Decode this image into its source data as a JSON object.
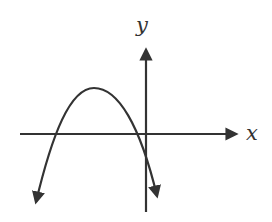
{
  "diagram": {
    "type": "graph-of-function",
    "axes": {
      "x_label": "x",
      "y_label": "y"
    },
    "curve": {
      "kind": "parabola",
      "opens": "down",
      "vertex_quadrant": "II",
      "x_intercepts": "two, both negative",
      "y_intercept": "negative",
      "ends": "arrows pointing down on both ends"
    },
    "colors": {
      "stroke": "#333333",
      "background": "#ffffff"
    }
  }
}
